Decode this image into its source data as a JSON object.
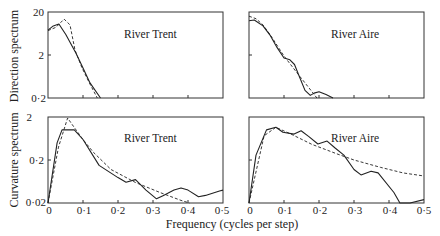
{
  "figure": {
    "ylabel_top": "Direction spectrum",
    "ylabel_bottom": "Curvature spectrum",
    "xlabel": "Frequency (cycles per step)"
  },
  "axes": {
    "top_yticks": [
      "20",
      "2",
      "0·2"
    ],
    "bottom_yticks": [
      "2",
      "0·2",
      "0·02"
    ],
    "xticks": [
      "0",
      "0·1",
      "0·2",
      "0·3",
      "0·4",
      "0·5"
    ]
  },
  "panels": [
    {
      "id": "direction-trent",
      "title": "River Trent"
    },
    {
      "id": "direction-aire",
      "title": "River Aire"
    },
    {
      "id": "curvature-trent",
      "title": "River Trent"
    },
    {
      "id": "curvature-aire",
      "title": "River Aire"
    }
  ],
  "chart_data": [
    {
      "type": "line",
      "title": "River Trent",
      "xlabel": "Frequency (cycles per step)",
      "ylabel": "Direction spectrum",
      "yscale": "log",
      "xlim": [
        0,
        0.5
      ],
      "ylim": [
        0.2,
        20
      ],
      "series": [
        {
          "name": "observed",
          "style": "solid",
          "x": [
            0,
            0.015,
            0.031,
            0.051,
            0.08,
            0.1,
            0.12,
            0.15
          ],
          "values": [
            7.6,
            9.5,
            10.5,
            6.0,
            2.2,
            1.0,
            0.45,
            0.2
          ]
        },
        {
          "name": "fitted",
          "style": "dashed",
          "x": [
            0,
            0.023,
            0.046,
            0.063,
            0.077,
            0.097,
            0.12,
            0.141
          ],
          "values": [
            7.4,
            8.8,
            13.7,
            10.0,
            2.6,
            1.0,
            0.42,
            0.2
          ]
        }
      ]
    },
    {
      "type": "line",
      "title": "River Aire",
      "xlabel": "Frequency (cycles per step)",
      "ylabel": "Direction spectrum",
      "yscale": "log",
      "xlim": [
        0,
        0.5
      ],
      "ylim": [
        0.2,
        20
      ],
      "series": [
        {
          "name": "observed",
          "style": "solid",
          "x": [
            0,
            0.015,
            0.04,
            0.06,
            0.08,
            0.1,
            0.117,
            0.13,
            0.14,
            0.16,
            0.175,
            0.186,
            0.2,
            0.22,
            0.24
          ],
          "values": [
            12.5,
            13.0,
            9.5,
            5.8,
            3.0,
            1.7,
            1.55,
            1.2,
            0.75,
            0.3,
            0.23,
            0.26,
            0.28,
            0.24,
            0.2
          ]
        },
        {
          "name": "fitted",
          "style": "dashed",
          "x": [
            0,
            0.02,
            0.04,
            0.06,
            0.1,
            0.14,
            0.18,
            0.194
          ],
          "values": [
            16.0,
            14.0,
            10.0,
            6.0,
            1.9,
            0.72,
            0.28,
            0.2
          ]
        }
      ]
    },
    {
      "type": "line",
      "title": "River Trent",
      "xlabel": "Frequency (cycles per step)",
      "ylabel": "Curvature spectrum",
      "yscale": "log",
      "xlim": [
        0,
        0.5
      ],
      "ylim": [
        0.02,
        2
      ],
      "series": [
        {
          "name": "observed",
          "style": "solid",
          "x": [
            0,
            0.026,
            0.04,
            0.075,
            0.1,
            0.146,
            0.2,
            0.223,
            0.25,
            0.28,
            0.31,
            0.33,
            0.36,
            0.38,
            0.4,
            0.43,
            0.45,
            0.49,
            0.5
          ],
          "values": [
            0.02,
            0.5,
            1.0,
            1.0,
            0.6,
            0.15,
            0.078,
            0.061,
            0.07,
            0.04,
            0.025,
            0.03,
            0.04,
            0.045,
            0.04,
            0.028,
            0.03,
            0.038,
            0.04
          ]
        },
        {
          "name": "fitted",
          "style": "dashed",
          "x": [
            0,
            0.03,
            0.056,
            0.07,
            0.1,
            0.13,
            0.18,
            0.25,
            0.32,
            0.38,
            0.404
          ],
          "values": [
            0.02,
            0.4,
            1.9,
            1.3,
            0.6,
            0.3,
            0.12,
            0.06,
            0.035,
            0.023,
            0.02
          ]
        }
      ]
    },
    {
      "type": "line",
      "title": "River Aire",
      "xlabel": "Frequency (cycles per step)",
      "ylabel": "Curvature spectrum",
      "yscale": "log",
      "xlim": [
        0,
        0.5
      ],
      "ylim": [
        0.02,
        2
      ],
      "series": [
        {
          "name": "observed",
          "style": "solid",
          "x": [
            0,
            0.02,
            0.05,
            0.077,
            0.097,
            0.129,
            0.149,
            0.171,
            0.197,
            0.223,
            0.246,
            0.271,
            0.3,
            0.32,
            0.349,
            0.369,
            0.414,
            0.431,
            0.46,
            0.5
          ],
          "values": [
            0.02,
            0.26,
            1.0,
            1.15,
            0.88,
            0.8,
            0.96,
            0.7,
            0.47,
            0.55,
            0.38,
            0.26,
            0.12,
            0.09,
            0.11,
            0.1,
            0.035,
            0.02,
            0.02,
            0.024
          ]
        },
        {
          "name": "fitted",
          "style": "dashed",
          "x": [
            0,
            0.043,
            0.077,
            0.12,
            0.18,
            0.25,
            0.3,
            0.375,
            0.44,
            0.5
          ],
          "values": [
            0.02,
            0.73,
            1.15,
            0.8,
            0.46,
            0.28,
            0.2,
            0.135,
            0.1,
            0.085
          ]
        }
      ]
    }
  ]
}
